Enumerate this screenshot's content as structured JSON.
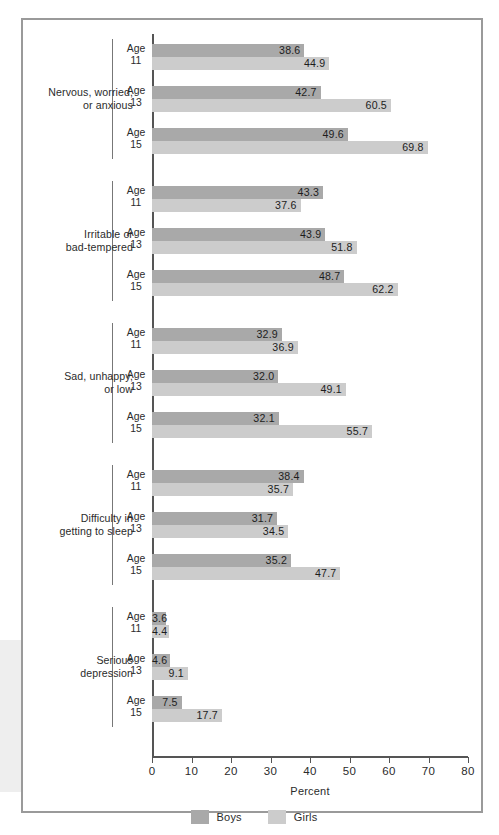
{
  "chart_data": {
    "type": "bar",
    "orientation": "horizontal",
    "title": "",
    "xlabel": "Percent",
    "ylabel": "",
    "xlim": [
      0,
      80
    ],
    "xticks": [
      0,
      10,
      20,
      30,
      40,
      50,
      60,
      70,
      80
    ],
    "xtick_labels": [
      "0",
      "10",
      "20",
      "30",
      "40",
      "50",
      "60",
      "70",
      "80"
    ],
    "grid": false,
    "legend_position": "bottom-center",
    "series": [
      {
        "name": "Boys",
        "color": "#a9a9a9",
        "values": [
          38.6,
          42.7,
          49.6,
          43.3,
          43.9,
          48.7,
          32.9,
          32.0,
          32.1,
          38.4,
          31.7,
          35.2,
          3.6,
          4.6,
          7.5
        ]
      },
      {
        "name": "Girls",
        "color": "#cccccc",
        "values": [
          44.9,
          60.5,
          69.8,
          37.6,
          51.8,
          62.2,
          36.9,
          49.1,
          55.7,
          35.7,
          34.5,
          47.7,
          4.4,
          9.1,
          17.7
        ]
      }
    ],
    "groups": [
      {
        "label": "Nervous, worried,\nor anxious",
        "label_line1": "Nervous, worried,",
        "label_line2": "or anxious",
        "rows": [
          {
            "age_line1": "Age",
            "age_line2": "11",
            "boys": 38.6,
            "girls": 44.9,
            "boys_text": "38.6",
            "girls_text": "44.9"
          },
          {
            "age_line1": "Age",
            "age_line2": "13",
            "boys": 42.7,
            "girls": 60.5,
            "boys_text": "42.7",
            "girls_text": "60.5"
          },
          {
            "age_line1": "Age",
            "age_line2": "15",
            "boys": 49.6,
            "girls": 69.8,
            "boys_text": "49.6",
            "girls_text": "69.8"
          }
        ]
      },
      {
        "label": "Irritable or\nbad-tempered",
        "label_line1": "Irritable or",
        "label_line2": "bad-tempered",
        "rows": [
          {
            "age_line1": "Age",
            "age_line2": "11",
            "boys": 43.3,
            "girls": 37.6,
            "boys_text": "43.3",
            "girls_text": "37.6"
          },
          {
            "age_line1": "Age",
            "age_line2": "13",
            "boys": 43.9,
            "girls": 51.8,
            "boys_text": "43.9",
            "girls_text": "51.8"
          },
          {
            "age_line1": "Age",
            "age_line2": "15",
            "boys": 48.7,
            "girls": 62.2,
            "boys_text": "48.7",
            "girls_text": "62.2"
          }
        ]
      },
      {
        "label": "Sad, unhappy,\nor low",
        "label_line1": "Sad, unhappy,",
        "label_line2": "or low",
        "rows": [
          {
            "age_line1": "Age",
            "age_line2": "11",
            "boys": 32.9,
            "girls": 36.9,
            "boys_text": "32.9",
            "girls_text": "36.9"
          },
          {
            "age_line1": "Age",
            "age_line2": "13",
            "boys": 32.0,
            "girls": 49.1,
            "boys_text": "32.0",
            "girls_text": "49.1"
          },
          {
            "age_line1": "Age",
            "age_line2": "15",
            "boys": 32.1,
            "girls": 55.7,
            "boys_text": "32.1",
            "girls_text": "55.7"
          }
        ]
      },
      {
        "label": "Difficulty in\ngetting to sleep",
        "label_line1": "Difficulty in",
        "label_line2": "getting to sleep",
        "rows": [
          {
            "age_line1": "Age",
            "age_line2": "11",
            "boys": 38.4,
            "girls": 35.7,
            "boys_text": "38.4",
            "girls_text": "35.7"
          },
          {
            "age_line1": "Age",
            "age_line2": "13",
            "boys": 31.7,
            "girls": 34.5,
            "boys_text": "31.7",
            "girls_text": "34.5"
          },
          {
            "age_line1": "Age",
            "age_line2": "15",
            "boys": 35.2,
            "girls": 47.7,
            "boys_text": "35.2",
            "girls_text": "47.7"
          }
        ]
      },
      {
        "label": "Serious\ndepression",
        "label_line1": "Serious",
        "label_line2": "depression",
        "rows": [
          {
            "age_line1": "Age",
            "age_line2": "11",
            "boys": 3.6,
            "girls": 4.4,
            "boys_text": "3.6",
            "girls_text": "4.4"
          },
          {
            "age_line1": "Age",
            "age_line2": "13",
            "boys": 4.6,
            "girls": 9.1,
            "boys_text": "4.6",
            "girls_text": "9.1"
          },
          {
            "age_line1": "Age",
            "age_line2": "15",
            "boys": 7.5,
            "girls": 17.7,
            "boys_text": "7.5",
            "girls_text": "17.7"
          }
        ]
      }
    ],
    "legend": [
      {
        "label": "Boys",
        "color": "#a9a9a9"
      },
      {
        "label": "Girls",
        "color": "#cccccc"
      }
    ]
  }
}
